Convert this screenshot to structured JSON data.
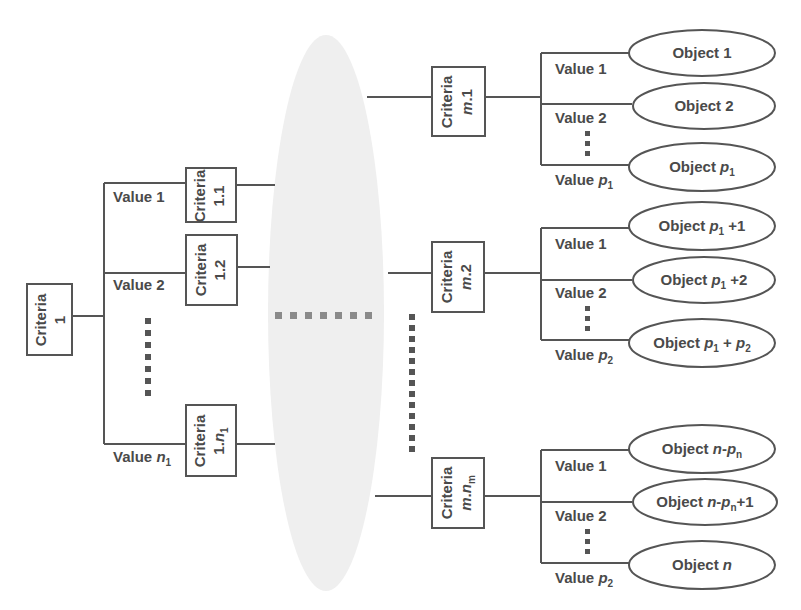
{
  "colors": {
    "stroke": "#555555",
    "text": "#4a4a4a",
    "cloud_fill": "#efefef",
    "background": "#ffffff"
  },
  "root": {
    "label": "Criteria",
    "index": "1"
  },
  "left_branches": [
    {
      "value_label": "Value 1",
      "criteria_label": "Criteria",
      "criteria_index": "1.1"
    },
    {
      "value_label": "Value 2",
      "criteria_label": "Criteria",
      "criteria_index": "1.2"
    },
    {
      "value_label": "Value",
      "value_var": "n",
      "value_sub": "1",
      "criteria_label": "Criteria",
      "criteria_index_prefix": "1.",
      "criteria_index_var": "n",
      "criteria_index_sub": "1"
    }
  ],
  "right_groups": [
    {
      "criteria_label": "Criteria",
      "criteria_index_var": "m",
      "criteria_index_suffix": ".1",
      "values": [
        {
          "label": "Value 1"
        },
        {
          "label": "Value 2"
        },
        {
          "label": "Value",
          "var": "p",
          "sub": "1"
        }
      ],
      "objects": [
        {
          "prefix": "Object 1"
        },
        {
          "prefix": "Object 2"
        },
        {
          "prefix": "Object ",
          "var": "p",
          "sub": "1"
        }
      ]
    },
    {
      "criteria_label": "Criteria",
      "criteria_index_var": "m",
      "criteria_index_suffix": ".2",
      "values": [
        {
          "label": "Value 1"
        },
        {
          "label": "Value 2"
        },
        {
          "label": "Value",
          "var": "p",
          "sub": "2"
        }
      ],
      "objects": [
        {
          "prefix": "Object ",
          "var": "p",
          "sub": "1",
          "suffix": " +1"
        },
        {
          "prefix": "Object ",
          "var": "p",
          "sub": "1",
          "suffix": " +2"
        },
        {
          "prefix": "Object ",
          "var": "p",
          "sub": "1",
          "mid": " + ",
          "var2": "p",
          "sub2": "2"
        }
      ]
    },
    {
      "criteria_label": "Criteria",
      "criteria_index_var": "m",
      "criteria_index_mid": ".",
      "criteria_index_var2": "n",
      "criteria_index_sub": "m",
      "values": [
        {
          "label": "Value 1"
        },
        {
          "label": "Value 2"
        },
        {
          "label": "Value",
          "var": "p",
          "sub": "2"
        }
      ],
      "objects": [
        {
          "prefix": "Object ",
          "var": "n",
          "mid": "-",
          "var2": "p",
          "sub2": "n"
        },
        {
          "prefix": "Object ",
          "var": "n",
          "mid": "-",
          "var2": "p",
          "sub2": "n",
          "suffix": "+1"
        },
        {
          "prefix": "Object ",
          "var": "n"
        }
      ]
    }
  ]
}
